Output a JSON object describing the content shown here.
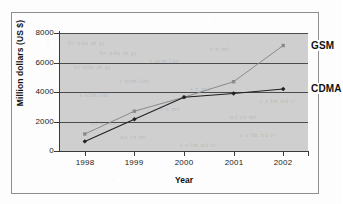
{
  "figure": {
    "kind": "scanned-line-chart",
    "ghost_text": [
      "hr ndn m gr",
      "t nrm ldn",
      "s n ml",
      "nd rn mt",
      "r s lm nd rt"
    ]
  },
  "chart_data": {
    "type": "line",
    "title": "",
    "xlabel": "Year",
    "ylabel": "Million dollars (US $)",
    "categories": [
      "1998",
      "1999",
      "2000",
      "2001",
      "2002"
    ],
    "x": [
      1998,
      1999,
      2000,
      2001,
      2002
    ],
    "ylim": [
      0,
      8000
    ],
    "yticks": [
      0,
      2000,
      4000,
      6000,
      8000
    ],
    "ytick_labels": [
      "0",
      "2000",
      "4000",
      "6000",
      "8000"
    ],
    "grid": true,
    "grid_axis": "y",
    "legend_position": "inline-end-of-line",
    "series": [
      {
        "name": "GSM",
        "label": "GSM",
        "color": "#8a8a8a",
        "marker": "square",
        "values": [
          1150,
          2700,
          3650,
          4700,
          7150
        ]
      },
      {
        "name": "CDMA",
        "label": "CDMA",
        "color": "#1f1f1f",
        "marker": "diamond",
        "values": [
          650,
          2150,
          3650,
          3900,
          4200
        ]
      }
    ]
  }
}
